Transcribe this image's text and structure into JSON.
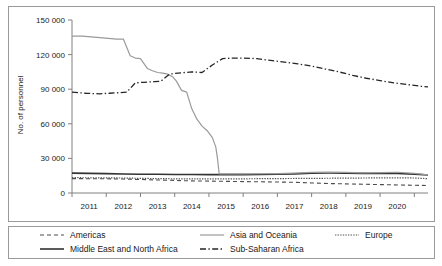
{
  "chart_data": {
    "type": "line",
    "title": "",
    "subtitle": "",
    "xlabel": "",
    "ylabel": "No. of personnel",
    "xlim": [
      2010.5,
      2020.9
    ],
    "ylim": [
      0,
      150000
    ],
    "grid": false,
    "legend_position": "bottom",
    "x_tick_labels": [
      "2011",
      "2012",
      "2013",
      "2014",
      "2015",
      "2016",
      "2017",
      "2018",
      "2019",
      "2020"
    ],
    "y_tick_labels": [
      "0",
      "30 000",
      "60 000",
      "90 000",
      "120 000",
      "150 000"
    ],
    "y_tick_values": [
      0,
      30000,
      60000,
      90000,
      120000,
      150000
    ],
    "series": [
      {
        "name": "Americas",
        "style": "dashed",
        "color": "#4d4d4d",
        "x": [
          2010.5,
          2011.0,
          2011.5,
          2012.0,
          2012.5,
          2013.0,
          2013.5,
          2014.0,
          2014.5,
          2015.0,
          2015.5,
          2016.0,
          2016.5,
          2017.0,
          2017.5,
          2018.0,
          2018.5,
          2019.0,
          2019.5,
          2020.0,
          2020.5,
          2020.9
        ],
        "values": [
          12500,
          12400,
          12300,
          12100,
          11700,
          11300,
          10900,
          10500,
          10300,
          10100,
          9900,
          9700,
          9500,
          9300,
          8700,
          8200,
          7900,
          7600,
          7300,
          7000,
          6700,
          6500
        ]
      },
      {
        "name": "Middle East and North Africa",
        "style": "solid-dark",
        "color": "#333333",
        "x": [
          2010.5,
          2011.0,
          2011.5,
          2012.0,
          2012.5,
          2013.0,
          2013.5,
          2014.0,
          2014.5,
          2015.0,
          2015.5,
          2016.0,
          2016.5,
          2017.0,
          2017.5,
          2018.0,
          2018.5,
          2019.0,
          2019.5,
          2020.0,
          2020.5,
          2020.9
        ],
        "values": [
          17200,
          17000,
          16800,
          16500,
          16300,
          16200,
          16100,
          16000,
          15900,
          15900,
          15900,
          16000,
          16200,
          16600,
          17100,
          17300,
          17200,
          17000,
          16900,
          16900,
          16400,
          15600
        ]
      },
      {
        "name": "Asia and Oceania",
        "style": "solid-light",
        "color": "#9a9a9a",
        "x": [
          2010.5,
          2010.8,
          2011.4,
          2011.8,
          2012.0,
          2012.2,
          2012.35,
          2012.5,
          2012.7,
          2012.85,
          2013.0,
          2013.15,
          2013.3,
          2013.45,
          2013.55,
          2013.7,
          2013.85,
          2014.0,
          2014.15,
          2014.3,
          2014.45,
          2014.6,
          2014.7,
          2014.75,
          2014.8,
          2015.0,
          2015.5,
          2016.0,
          2016.5,
          2017.0,
          2017.5,
          2018.0,
          2018.5,
          2019.0,
          2019.5,
          2020.0,
          2020.5,
          2020.9
        ],
        "values": [
          136000,
          136000,
          134500,
          133500,
          133500,
          119000,
          117000,
          116500,
          108000,
          106000,
          104500,
          104000,
          103000,
          100500,
          97000,
          89000,
          87500,
          73000,
          64000,
          58000,
          54000,
          48000,
          40000,
          30000,
          16500,
          16500,
          16600,
          16700,
          16800,
          17200,
          17800,
          18100,
          17900,
          17400,
          17600,
          18000,
          17000,
          15800
        ]
      },
      {
        "name": "Europe",
        "style": "dotted",
        "color": "#555555",
        "x": [
          2010.5,
          2011.0,
          2011.5,
          2012.0,
          2012.5,
          2013.0,
          2013.5,
          2014.0,
          2014.5,
          2015.0,
          2015.5,
          2016.0,
          2016.5,
          2017.0,
          2017.5,
          2018.0,
          2018.5,
          2019.0,
          2019.5,
          2020.0,
          2020.5,
          2020.9
        ],
        "values": [
          13300,
          13200,
          13100,
          13000,
          12700,
          12500,
          12300,
          12200,
          12200,
          12200,
          12300,
          12400,
          12500,
          12600,
          12700,
          12800,
          12900,
          13000,
          13100,
          13200,
          13000,
          12400
        ]
      },
      {
        "name": "Sub-Saharan Africa",
        "style": "dashdot",
        "color": "#262626",
        "x": [
          2010.5,
          2010.9,
          2011.3,
          2011.6,
          2011.9,
          2012.1,
          2012.35,
          2012.6,
          2012.9,
          2013.1,
          2013.35,
          2013.6,
          2013.8,
          2014.0,
          2014.3,
          2014.6,
          2014.9,
          2015.2,
          2015.5,
          2015.9,
          2016.3,
          2016.7,
          2017.1,
          2017.5,
          2017.9,
          2018.3,
          2018.7,
          2019.1,
          2019.5,
          2019.9,
          2020.3,
          2020.7,
          2020.9
        ],
        "values": [
          87500,
          86500,
          86000,
          86500,
          87000,
          87500,
          95500,
          96000,
          96500,
          97000,
          103000,
          104000,
          104500,
          105000,
          104500,
          111000,
          116500,
          117000,
          117000,
          116500,
          115000,
          113500,
          112000,
          110000,
          107500,
          105000,
          102000,
          99500,
          97500,
          95500,
          94000,
          92500,
          92000
        ]
      }
    ]
  },
  "axis": {
    "ylabel": "No. of personnel"
  },
  "legend": {
    "items": [
      {
        "label": "Americas",
        "style": "dashed"
      },
      {
        "label": "Asia and Oceania",
        "style": "solid-light"
      },
      {
        "label": "Europe",
        "style": "dotted"
      },
      {
        "label": "Middle East and North Africa",
        "style": "solid-dark"
      },
      {
        "label": "Sub-Saharan Africa",
        "style": "dashdot"
      }
    ]
  }
}
